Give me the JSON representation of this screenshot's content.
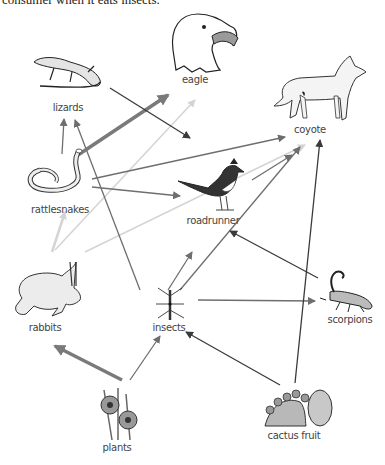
{
  "caption": "consumer when it eats insects.",
  "organisms": {
    "eagle": {
      "label": "eagle",
      "icon": "eagle-icon"
    },
    "coyote": {
      "label": "coyote",
      "icon": "coyote-icon"
    },
    "lizards": {
      "label": "lizards",
      "icon": "lizard-icon"
    },
    "rattlesnakes": {
      "label": "rattlesnakes",
      "icon": "rattlesnake-icon"
    },
    "roadrunner": {
      "label": "roadrunner",
      "icon": "roadrunner-icon"
    },
    "rabbits": {
      "label": "rabbits",
      "icon": "rabbit-icon"
    },
    "insects": {
      "label": "insects",
      "icon": "insect-icon"
    },
    "scorpions": {
      "label": "scorpions",
      "icon": "scorpion-icon"
    },
    "plants": {
      "label": "plants",
      "icon": "plants-icon"
    },
    "cactus_fruit": {
      "label": "cactus fruit",
      "icon": "cactus-fruit-icon"
    }
  },
  "arrows": [
    {
      "from": "lizards",
      "to": "roadrunner",
      "shade": "dark"
    },
    {
      "from": "rattlesnakes",
      "to": "eagle",
      "shade": "medium-thick"
    },
    {
      "from": "rattlesnakes",
      "to": "lizards",
      "shade": "medium"
    },
    {
      "from": "rattlesnakes",
      "to": "coyote",
      "shade": "medium"
    },
    {
      "from": "rattlesnakes",
      "to": "roadrunner",
      "shade": "medium"
    },
    {
      "from": "rabbits",
      "to": "eagle",
      "shade": "light"
    },
    {
      "from": "rabbits",
      "to": "rattlesnakes",
      "shade": "light"
    },
    {
      "from": "rabbits",
      "to": "coyote",
      "shade": "light"
    },
    {
      "from": "insects",
      "to": "lizards",
      "shade": "medium"
    },
    {
      "from": "insects",
      "to": "roadrunner",
      "shade": "medium"
    },
    {
      "from": "insects",
      "to": "coyote",
      "shade": "medium"
    },
    {
      "from": "insects",
      "to": "scorpions",
      "shade": "medium"
    },
    {
      "from": "roadrunner",
      "to": "coyote",
      "shade": "medium"
    },
    {
      "from": "scorpions",
      "to": "roadrunner",
      "shade": "dark"
    },
    {
      "from": "plants",
      "to": "rabbits",
      "shade": "medium-thick"
    },
    {
      "from": "plants",
      "to": "insects",
      "shade": "medium"
    },
    {
      "from": "cactus_fruit",
      "to": "insects",
      "shade": "dark"
    },
    {
      "from": "cactus_fruit",
      "to": "coyote",
      "shade": "dark"
    }
  ],
  "colors": {
    "dark": "#3a3a3a",
    "medium": "#6e6e6e",
    "light": "#d4d4d4",
    "thick": "#7a7a7a"
  }
}
